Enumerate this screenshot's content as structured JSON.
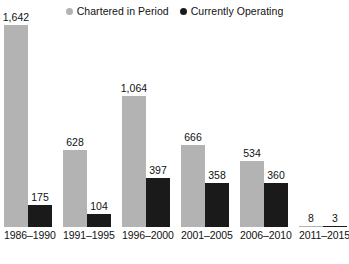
{
  "legend": {
    "items": [
      {
        "label": "Chartered in Period",
        "marker": "circle",
        "color": "#b3b3b3",
        "icon": "legend-dot-icon"
      },
      {
        "label": "Currently Operating",
        "marker": "circle",
        "color": "#1a1a1a",
        "icon": "legend-dot-icon"
      }
    ]
  },
  "chart_data": {
    "type": "bar",
    "title": "",
    "subtitle": "",
    "xlabel": "",
    "ylabel": "",
    "grid": false,
    "legend_position": "top-center",
    "ylim": [
      0,
      1642
    ],
    "axis_visible": false,
    "categories": [
      "1986–1990",
      "1991–1995",
      "1996–2000",
      "2001–2005",
      "2006–2010",
      "2011–2015"
    ],
    "series": [
      {
        "name": "Chartered in Period",
        "color": "#b3b3b3",
        "values": [
          1642,
          628,
          1064,
          666,
          534,
          8
        ],
        "labels": [
          "1,642",
          "628",
          "1,064",
          "666",
          "534",
          "8"
        ]
      },
      {
        "name": "Currently Operating",
        "color": "#1a1a1a",
        "values": [
          175,
          104,
          397,
          358,
          360,
          3
        ],
        "labels": [
          "175",
          "104",
          "397",
          "358",
          "360",
          "3"
        ]
      }
    ]
  },
  "colors": {
    "chartered": "#b3b3b3",
    "operating": "#1a1a1a",
    "background": "#ffffff",
    "text": "#111111"
  }
}
